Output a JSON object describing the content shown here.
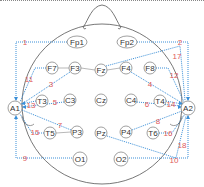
{
  "diagram": {
    "type": "eeg-10-20-montage",
    "colors": {
      "head_outline": "#555555",
      "electrode_stroke": "#777777",
      "electrode_fill": "#ffffff",
      "electrode_text": "#333333",
      "connection_line": "#3a8fd8",
      "number_label": "#e05a5a"
    },
    "electrodes": [
      {
        "id": "Fp1",
        "label": "Fp1"
      },
      {
        "id": "Fp2",
        "label": "Fp2"
      },
      {
        "id": "F7",
        "label": "F7"
      },
      {
        "id": "F3",
        "label": "F3"
      },
      {
        "id": "Fz",
        "label": "Fz"
      },
      {
        "id": "F4",
        "label": "F4"
      },
      {
        "id": "F8",
        "label": "F8"
      },
      {
        "id": "A1",
        "label": "A1"
      },
      {
        "id": "T3",
        "label": "T3"
      },
      {
        "id": "C3",
        "label": "C3"
      },
      {
        "id": "Cz",
        "label": "Cz"
      },
      {
        "id": "C4",
        "label": "C4"
      },
      {
        "id": "T4",
        "label": "T4"
      },
      {
        "id": "A2",
        "label": "A2"
      },
      {
        "id": "T5",
        "label": "T5"
      },
      {
        "id": "P3",
        "label": "P3"
      },
      {
        "id": "Pz",
        "label": "Pz"
      },
      {
        "id": "P4",
        "label": "P4"
      },
      {
        "id": "T6",
        "label": "T6"
      },
      {
        "id": "O1",
        "label": "O1"
      },
      {
        "id": "O2",
        "label": "O2"
      }
    ],
    "connection_numbers": [
      "1",
      "2",
      "3",
      "4",
      "5",
      "6",
      "7",
      "8",
      "9",
      "10",
      "11",
      "12",
      "13",
      "14",
      "15",
      "16",
      "17",
      "18"
    ]
  }
}
